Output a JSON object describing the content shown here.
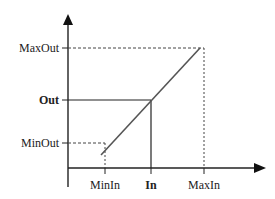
{
  "diagram": {
    "type": "linear-mapping",
    "y_axis_labels": {
      "max": "MaxOut",
      "current": "Out",
      "min": "MinOut"
    },
    "x_axis_labels": {
      "min": "MinIn",
      "current": "In",
      "max": "MaxIn"
    },
    "colors": {
      "axis": "#222222",
      "line": "#555555",
      "dashed": "#444444"
    }
  }
}
